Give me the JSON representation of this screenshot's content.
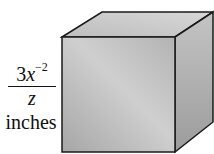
{
  "figure": {
    "shape": "cube",
    "side_label": {
      "numerator_coefficient": "3",
      "numerator_variable": "x",
      "numerator_exponent": "−2",
      "denominator": "z",
      "units": "inches"
    },
    "colors": {
      "edge": "#1a1a1a",
      "front_face": "#b8b8b8",
      "top_face": "#cfcfcf",
      "side_face": "#a9a9a9"
    }
  }
}
